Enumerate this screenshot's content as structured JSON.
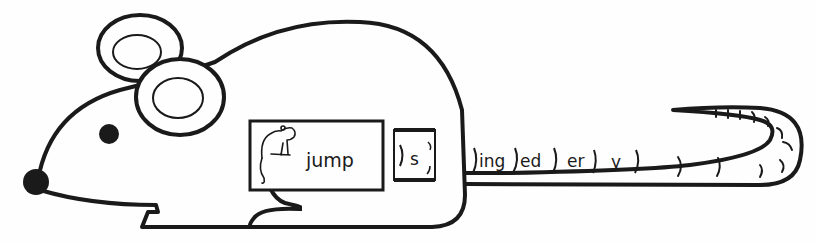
{
  "worksheet": {
    "base_word": "jump",
    "slider_suffix": "s",
    "tail_suffixes": [
      "ing",
      "ed",
      "er",
      "y"
    ],
    "icons": {
      "mouse_body": "mouse-outline-icon",
      "word_picture": "jumping-mouse-icon"
    },
    "colors": {
      "ink": "#1a1a1a",
      "paper": "#fefefe"
    }
  }
}
